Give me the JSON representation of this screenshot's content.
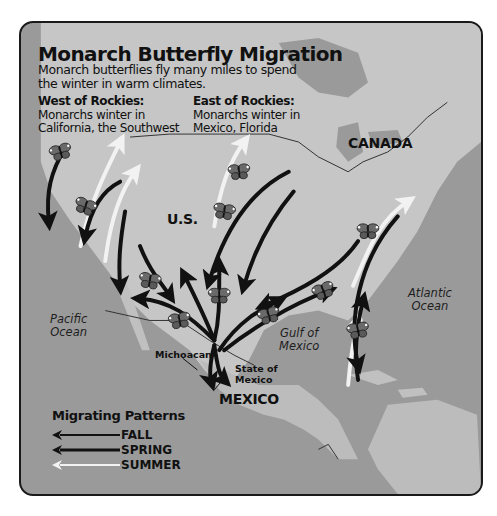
{
  "title": "Monarch Butterfly Migration",
  "subtitle": "Monarch butterflies fly many miles to spend the winter in warm climates.",
  "regions": {
    "west": {
      "heading": "West of Rockies:",
      "line1": "Monarchs winter in",
      "line2": "California, the Southwest"
    },
    "east": {
      "heading": "East of Rockies:",
      "line1": "Monarchs winter in",
      "line2": "Mexico, Florida"
    }
  },
  "map_labels": {
    "canada": "CANADA",
    "us": "U.S.",
    "mexico": "MEXICO",
    "pacific_line1": "Pacific",
    "pacific_line2": "Ocean",
    "atlantic_line1": "Atlantic",
    "atlantic_line2": "Ocean",
    "gulf_line1": "Gulf of",
    "gulf_line2": "Mexico",
    "michoacan": "Michoacan",
    "state_of_mexico_line1": "State of",
    "state_of_mexico_line2": "Mexico"
  },
  "legend": {
    "title": "Migrating Patterns",
    "items": [
      {
        "label": "FALL",
        "color": "#111111"
      },
      {
        "label": "SPRING",
        "color": "#111111"
      },
      {
        "label": "SUMMER",
        "color": "#f2f2f2"
      }
    ]
  },
  "colors": {
    "ocean": "#9a9a9a",
    "land": "#c8c8c8",
    "fall_spring_arrow": "#111111",
    "summer_arrow": "#f2f2f2",
    "frame_border": "#1a1a1a"
  }
}
